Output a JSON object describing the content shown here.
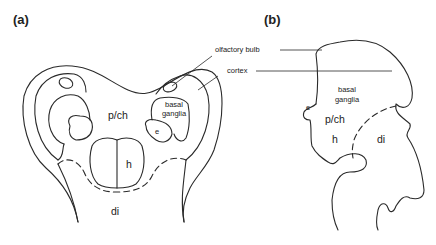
{
  "figure": {
    "panels": [
      {
        "id": "a",
        "label": "(a)",
        "view": "horizontal section",
        "regions": {
          "pch": "p/ch",
          "basal_ganglia_line1": "basal",
          "basal_ganglia_line2": "ganglia",
          "e": "e",
          "h": "h",
          "di": "di"
        }
      },
      {
        "id": "b",
        "label": "(b)",
        "view": "lateral view",
        "regions": {
          "basal_ganglia_line1": "basal",
          "basal_ganglia_line2": "ganglia",
          "e": "e",
          "pch": "p/ch",
          "h": "h",
          "di": "di"
        }
      }
    ],
    "callouts": {
      "olfactory_bulb": "olfactory bulb",
      "cortex": "cortex"
    },
    "colors": {
      "line": "#2a2a2a",
      "text": "#222222",
      "background": "#ffffff"
    }
  }
}
